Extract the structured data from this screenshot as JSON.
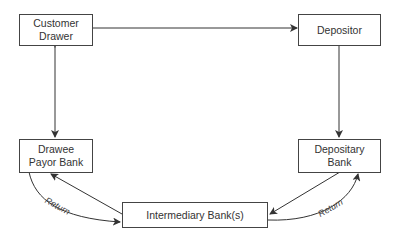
{
  "diagram": {
    "nodes": [
      {
        "id": "customer_drawer",
        "line1": "Customer",
        "line2": "Drawer"
      },
      {
        "id": "depositor",
        "label": "Depositor"
      },
      {
        "id": "drawee_payor_bank",
        "line1": "Drawee",
        "line2": "Payor Bank"
      },
      {
        "id": "depositary_bank",
        "line1": "Depositary",
        "line2": "Bank"
      },
      {
        "id": "intermediary_banks",
        "label": "Intermediary Bank(s)"
      }
    ],
    "edges": [
      {
        "from": "customer_drawer",
        "to": "depositor",
        "type": "arrow"
      },
      {
        "from": "customer_drawer",
        "to": "drawee_payor_bank",
        "type": "bidirectional"
      },
      {
        "from": "depositor",
        "to": "depositary_bank",
        "type": "arrow"
      },
      {
        "from": "depositary_bank",
        "to": "intermediary_banks",
        "type": "arrow"
      },
      {
        "from": "intermediary_banks",
        "to": "drawee_payor_bank",
        "type": "arrow"
      },
      {
        "from": "drawee_payor_bank",
        "to": "intermediary_banks",
        "type": "curved-arrow",
        "label": "Return"
      },
      {
        "from": "intermediary_banks",
        "to": "depositary_bank",
        "type": "curved-arrow",
        "label": "Return"
      }
    ],
    "return_label_left": "Return",
    "return_label_right": "Return"
  }
}
